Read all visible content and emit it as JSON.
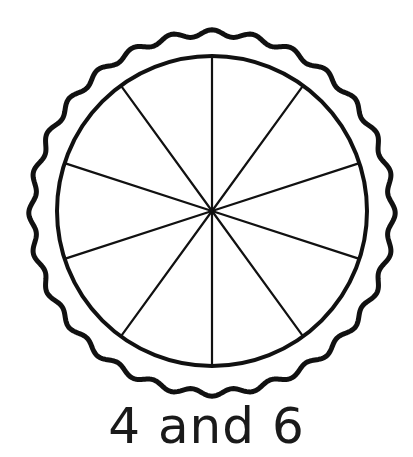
{
  "diagram": {
    "type": "fraction-pie",
    "slices": 10,
    "crust_bumps": 28,
    "caption": "4 and 6",
    "colors": {
      "stroke": "#111111",
      "fill": "#ffffff"
    }
  }
}
